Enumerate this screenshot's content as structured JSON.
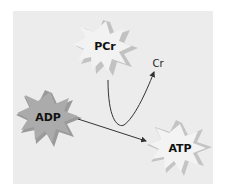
{
  "diagram": {
    "nodes": [
      {
        "id": "pcr",
        "label": "PCr",
        "shape": "starburst",
        "fill": "#f0f0f0",
        "shadow": "#b8b8b8"
      },
      {
        "id": "adp",
        "label": "ADP",
        "shape": "starburst",
        "fill": "#a8a8a8",
        "shadow": "#8a8a8a"
      },
      {
        "id": "atp",
        "label": "ATP",
        "shape": "starburst",
        "fill": "#f2f2f2",
        "shadow": "#bdbdbd"
      },
      {
        "id": "cr",
        "label": "Cr",
        "shape": "text"
      }
    ],
    "edges": [
      {
        "from": "pcr",
        "to": "cr",
        "style": "curved-arrow"
      },
      {
        "from": "adp",
        "to": "atp",
        "style": "straight-arrow"
      }
    ],
    "colors": {
      "background": "#ececec",
      "arrow": "#333333"
    }
  }
}
